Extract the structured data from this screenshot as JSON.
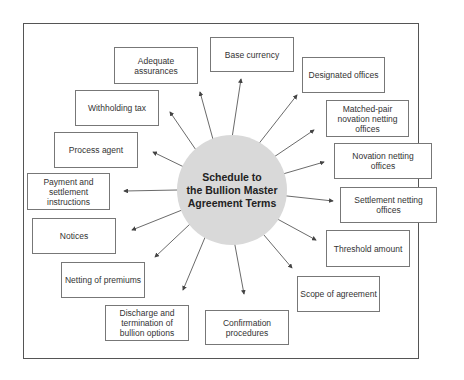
{
  "diagram": {
    "center": {
      "title": "Schedule to\nthe Bullion Master\nAgreement Terms"
    },
    "nodes": [
      {
        "id": "adequate-assurances",
        "label": "Adequate assurances"
      },
      {
        "id": "base-currency",
        "label": "Base currency"
      },
      {
        "id": "designated-offices",
        "label": "Designated offices"
      },
      {
        "id": "withholding-tax",
        "label": "Withholding tax"
      },
      {
        "id": "matched-pair",
        "label": "Matched-pair novation netting offices"
      },
      {
        "id": "process-agent",
        "label": "Process agent"
      },
      {
        "id": "novation-netting",
        "label": "Novation netting offices"
      },
      {
        "id": "payment-settlement",
        "label": "Payment and settlement instructions"
      },
      {
        "id": "settlement-netting",
        "label": "Settlement netting offices"
      },
      {
        "id": "notices",
        "label": "Notices"
      },
      {
        "id": "threshold-amount",
        "label": "Threshold amount"
      },
      {
        "id": "netting-premiums",
        "label": "Netting of premiums"
      },
      {
        "id": "scope-agreement",
        "label": "Scope of agreement"
      },
      {
        "id": "discharge-termination",
        "label": "Discharge and termination of bullion options"
      },
      {
        "id": "confirmation-procedures",
        "label": "Confirmation procedures"
      }
    ],
    "colors": {
      "hub": "#d9d9d9",
      "border": "#777777",
      "arrow": "#444444"
    }
  }
}
